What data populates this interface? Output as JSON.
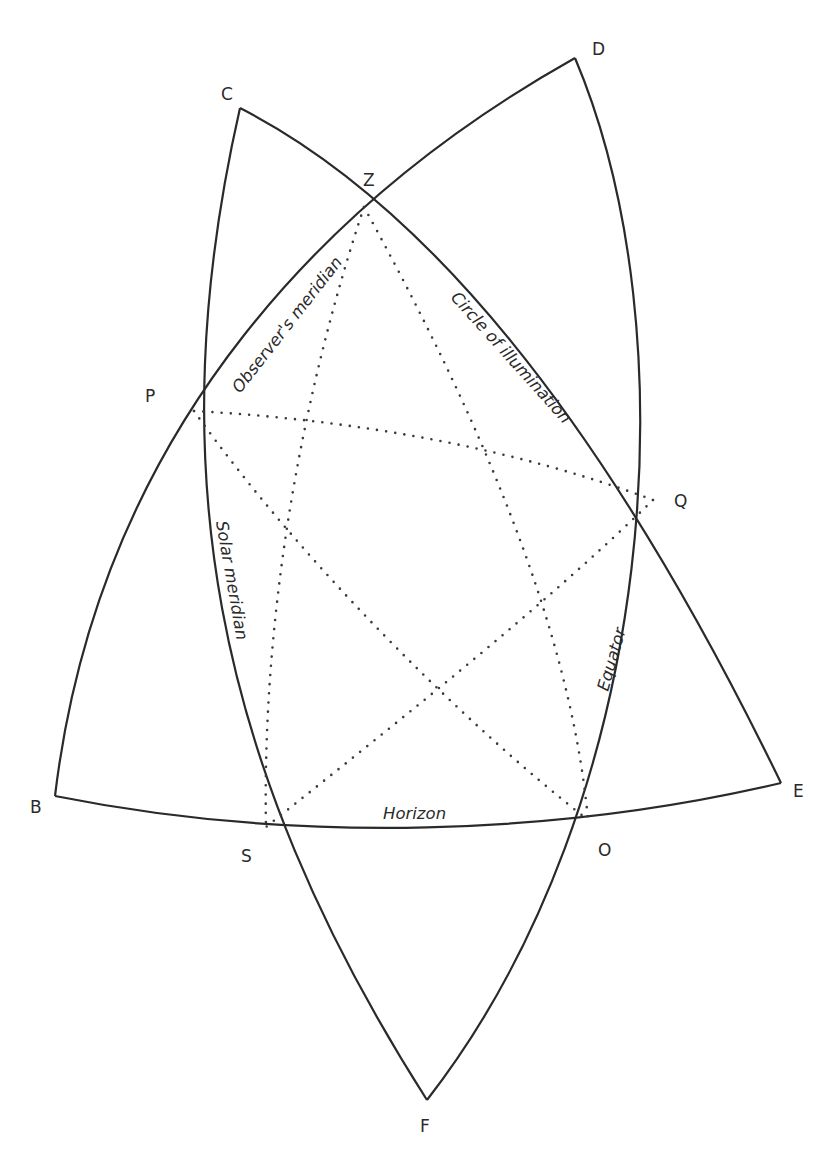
{
  "diagram": {
    "type": "spherical-triangle-construction",
    "colors": {
      "stroke": "#2a2a2a",
      "background": "#ffffff"
    },
    "points": {
      "B": {
        "label": "B",
        "x": 55,
        "y": 796
      },
      "C": {
        "label": "C",
        "x": 240,
        "y": 108
      },
      "D": {
        "label": "D",
        "x": 575,
        "y": 58
      },
      "E": {
        "label": "E",
        "x": 781,
        "y": 783
      },
      "F": {
        "label": "F",
        "x": 427,
        "y": 1100
      },
      "Z": {
        "label": "Z",
        "x": 364,
        "y": 207
      },
      "P": {
        "label": "P",
        "x": 194,
        "y": 411
      },
      "Q": {
        "label": "Q",
        "x": 653,
        "y": 500
      },
      "S": {
        "label": "S",
        "x": 266,
        "y": 827
      },
      "O": {
        "label": "O",
        "x": 588,
        "y": 820
      }
    },
    "great_circles": [
      {
        "name": "Observer's meridian",
        "from": "D",
        "to": "B",
        "through": [
          "Z",
          "P"
        ]
      },
      {
        "name": "Circle of illumination",
        "from": "C",
        "to": "E",
        "through": [
          "Z",
          "Q"
        ]
      },
      {
        "name": "Solar meridian",
        "from": "C",
        "to": "F",
        "through": [
          "P",
          "S"
        ]
      },
      {
        "name": "Equator",
        "from": "D",
        "to": "F",
        "through": [
          "Q",
          "O"
        ]
      },
      {
        "name": "Horizon",
        "from": "B",
        "to": "E",
        "through": [
          "S",
          "O"
        ]
      }
    ],
    "dotted_arcs": [
      {
        "from": "Z",
        "to": "S"
      },
      {
        "from": "Z",
        "to": "O"
      },
      {
        "from": "P",
        "to": "Q"
      },
      {
        "from": "P",
        "to": "O"
      },
      {
        "from": "Q",
        "to": "S"
      }
    ],
    "labels": {
      "observers_meridian": "Observer's meridian",
      "circle_of_illumination": "Circle of illumination",
      "solar_meridian": "Solar meridian",
      "equator": "Equator",
      "horizon": "Horizon"
    }
  }
}
